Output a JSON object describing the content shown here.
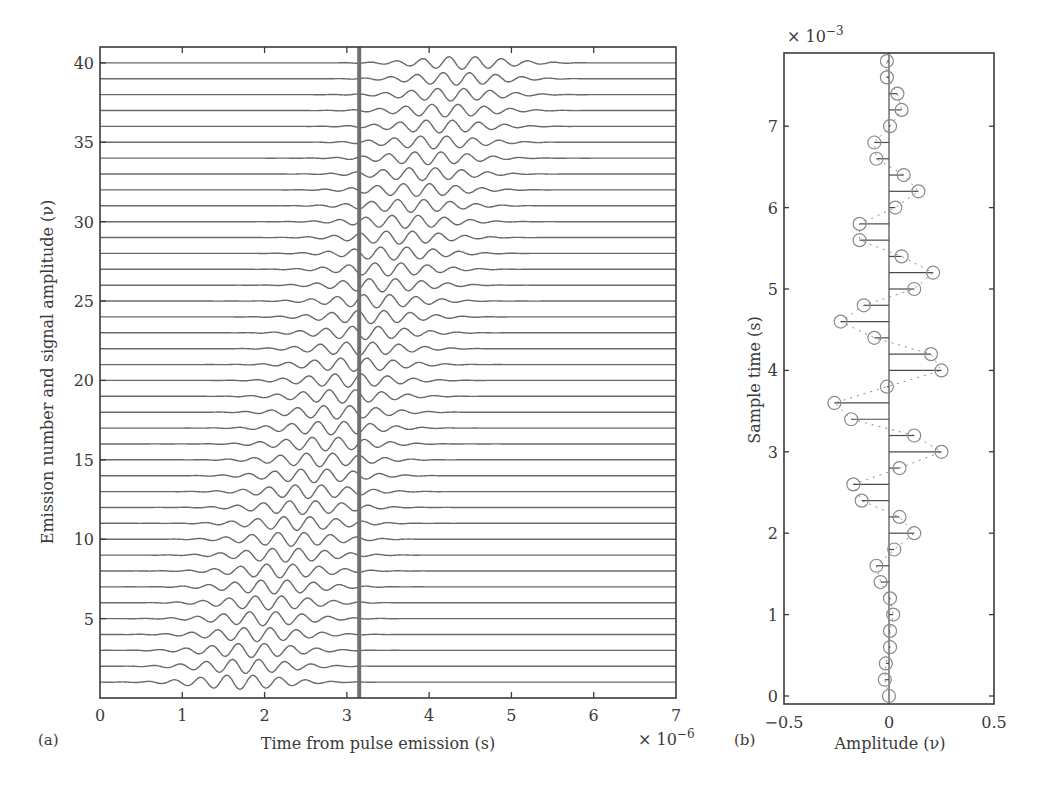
{
  "chart_data": [
    {
      "panel": "(a)",
      "type": "line",
      "title": "",
      "xlabel": "Time from pulse emission (s)",
      "x_multiplier": "× 10^-6",
      "ylabel": "Emission number and signal amplitude (ν)",
      "xlim": [
        0,
        7e-06
      ],
      "ylim": [
        0,
        41
      ],
      "x_ticks": [
        0,
        1,
        2,
        3,
        4,
        5,
        6,
        7
      ],
      "y_ticks": [
        5,
        10,
        15,
        20,
        25,
        30,
        35,
        40
      ],
      "grid": false,
      "series_count": 40,
      "series_description": "40 stacked received-signal traces (emission 1..40), each a Gaussian-windowed sinusoidal echo; the echo packet arrives later with increasing emission number",
      "packet_center_us": {
        "emission_1": 1.7,
        "emission_40": 4.4
      },
      "packet_period_us": 0.32,
      "packet_width_us": 0.75,
      "packet_amplitude": {
        "emission_1": 0.45,
        "emission_40": 0.4
      },
      "sample_marker": {
        "type": "vertical_line",
        "x_us": 3.15,
        "description": "sampling instant"
      }
    },
    {
      "panel": "(b)",
      "type": "scatter",
      "subtype": "horizontal stem plot",
      "title": "",
      "xlabel": "Amplitude (ν)",
      "ylabel": "Sample time (s)",
      "y_multiplier": "× 10^-3",
      "xlim": [
        -0.5,
        0.5
      ],
      "ylim": [
        -0.1,
        7.9
      ],
      "x_ticks": [
        -0.5,
        0,
        0.5
      ],
      "x_tick_labels": [
        "−0.5",
        "0",
        "0.5"
      ],
      "y_ticks": [
        0,
        1,
        2,
        3,
        4,
        5,
        6,
        7
      ],
      "grid": false,
      "sample_times_ms": [
        0,
        0.2,
        0.4,
        0.6,
        0.8,
        1.0,
        1.2,
        1.4,
        1.6,
        1.8,
        2.0,
        2.2,
        2.4,
        2.6,
        2.8,
        3.0,
        3.2,
        3.4,
        3.6,
        3.8,
        4.0,
        4.2,
        4.4,
        4.6,
        4.8,
        5.0,
        5.2,
        5.4,
        5.6,
        5.8,
        6.0,
        6.2,
        6.4,
        6.6,
        6.8,
        7.0,
        7.2,
        7.4,
        7.6,
        7.8
      ],
      "amplitudes": [
        0,
        -0.02,
        -0.015,
        0.005,
        0.005,
        0.02,
        0.005,
        -0.04,
        -0.06,
        0.025,
        0.12,
        0.05,
        -0.13,
        -0.17,
        0.05,
        0.25,
        0.12,
        -0.18,
        -0.26,
        -0.01,
        0.25,
        0.2,
        -0.07,
        -0.23,
        -0.12,
        0.12,
        0.21,
        0.06,
        -0.14,
        -0.14,
        0.03,
        0.14,
        0.07,
        -0.06,
        -0.07,
        0.005,
        0.06,
        0.04,
        -0.01,
        -0.01
      ]
    }
  ],
  "panel_a": {
    "label": "(a)",
    "xlabel": "Time from pulse emission (s)",
    "ylabel": "Emission number and signal amplitude (ν)",
    "x_exponent_base": "× 10",
    "x_exponent": "−6"
  },
  "panel_b": {
    "label": "(b)",
    "xlabel": "Amplitude (ν)",
    "ylabel": "Sample time (s)",
    "y_exponent_base": "× 10",
    "y_exponent": "−3"
  }
}
